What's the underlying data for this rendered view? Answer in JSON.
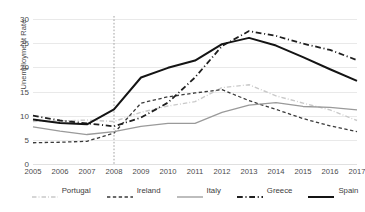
{
  "chart_data": {
    "type": "line",
    "title": "",
    "xlabel": "",
    "ylabel": "Unemployment Rate",
    "x": [
      2005,
      2006,
      2007,
      2008,
      2009,
      2010,
      2011,
      2012,
      2013,
      2014,
      2015,
      2016,
      2017
    ],
    "xtick_labels": [
      "2005",
      "2006",
      "2007",
      "2008",
      "2009",
      "2010",
      "2011",
      "2012",
      "2013",
      "2014",
      "2015",
      "2016",
      "2017"
    ],
    "ytick_labels": [
      "0",
      "5",
      "10",
      "15",
      "20",
      "25",
      "30"
    ],
    "yticks": [
      0,
      5,
      10,
      15,
      20,
      25,
      30
    ],
    "ylim": [
      0,
      30
    ],
    "xlim": [
      2005,
      2017
    ],
    "grid": "horizontal",
    "legend_position": "bottom",
    "annotations": [
      {
        "name": "crisis-reference-line",
        "type": "vline",
        "x": 2008,
        "style": "dotted",
        "color": "#8a8a8a"
      }
    ],
    "series": [
      {
        "name": "Portugal",
        "color": "#c9c9c9",
        "dash": "dashdot",
        "width": 1.4,
        "values": [
          8.8,
          8.9,
          9.1,
          8.8,
          10.7,
          12.0,
          12.9,
          15.8,
          16.4,
          14.1,
          12.6,
          11.2,
          9.0
        ]
      },
      {
        "name": "Ireland",
        "color": "#3a3a3a",
        "dash": "dashed",
        "width": 1.3,
        "values": [
          4.4,
          4.5,
          4.7,
          6.4,
          12.6,
          13.9,
          14.7,
          15.4,
          13.1,
          11.3,
          9.4,
          7.9,
          6.7
        ]
      },
      {
        "name": "Italy",
        "color": "#9a9a9a",
        "dash": "solid",
        "width": 1.3,
        "values": [
          7.7,
          6.8,
          6.1,
          6.7,
          7.8,
          8.4,
          8.4,
          10.7,
          12.2,
          12.7,
          11.9,
          11.7,
          11.2
        ]
      },
      {
        "name": "Greece",
        "color": "#1f1f1f",
        "dash": "dashdot",
        "width": 1.8,
        "values": [
          10.0,
          9.0,
          8.4,
          7.8,
          9.6,
          12.7,
          17.9,
          24.4,
          27.5,
          26.5,
          24.9,
          23.6,
          21.5
        ]
      },
      {
        "name": "Spain",
        "color": "#141414",
        "dash": "solid",
        "width": 2.0,
        "values": [
          9.2,
          8.5,
          8.2,
          11.3,
          17.9,
          19.9,
          21.4,
          24.8,
          26.1,
          24.5,
          22.1,
          19.6,
          17.2
        ]
      }
    ]
  },
  "legend": {
    "items": [
      {
        "label": "Portugal"
      },
      {
        "label": "Ireland"
      },
      {
        "label": "Italy"
      },
      {
        "label": "Greece"
      },
      {
        "label": "Spain"
      }
    ]
  }
}
